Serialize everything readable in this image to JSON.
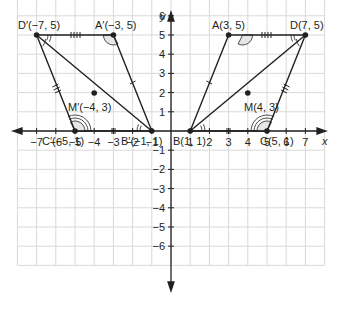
{
  "figure": {
    "type": "coordinate-plane-diagram",
    "axes": {
      "x_label": "x",
      "y_label": "y",
      "x_ticks": [
        "-7",
        "-6",
        "-5",
        "-4",
        "-3",
        "-2",
        "-1",
        "1",
        "2",
        "3",
        "4",
        "5",
        "6",
        "7"
      ],
      "y_ticks": [
        "6",
        "5",
        "4",
        "3",
        "2",
        "1",
        "-1",
        "-2",
        "-3",
        "-4",
        "-5",
        "-6"
      ],
      "x_range": [
        -8,
        8
      ],
      "y_range": [
        -7,
        7
      ],
      "grid": true
    },
    "parallelogram_right": {
      "vertices": [
        {
          "name": "A",
          "label": "A(3, 5)",
          "x": 3,
          "y": 5
        },
        {
          "name": "B",
          "label": "B(1, 1)",
          "x": 1,
          "y": 1
        },
        {
          "name": "C",
          "label": "C(5, 1)",
          "x": 5,
          "y": 1
        },
        {
          "name": "D",
          "label": "D(7, 5)",
          "x": 7,
          "y": 5
        }
      ],
      "midpoint": {
        "name": "M",
        "label": "M(4, 3)",
        "x": 4,
        "y": 3
      },
      "diagonal": [
        "B",
        "D"
      ]
    },
    "parallelogram_left": {
      "vertices": [
        {
          "name": "A'",
          "label": "A′(−3, 5)",
          "x": -3,
          "y": 5
        },
        {
          "name": "B'",
          "label": "B′(−1, 1)",
          "x": -1,
          "y": 1
        },
        {
          "name": "C'",
          "label": "C′(−5, 1)",
          "x": -5,
          "y": 1
        },
        {
          "name": "D'",
          "label": "D′(−7, 5)",
          "x": -7,
          "y": 5
        }
      ],
      "midpoint": {
        "name": "M'",
        "label": "M′(−4, 3)",
        "x": -4,
        "y": 3
      },
      "diagonal": [
        "B'",
        "D'"
      ]
    },
    "colors": {
      "line": "#231f20",
      "grid": "#d9d9d9",
      "angle_fill": "#e6e6e6"
    }
  }
}
